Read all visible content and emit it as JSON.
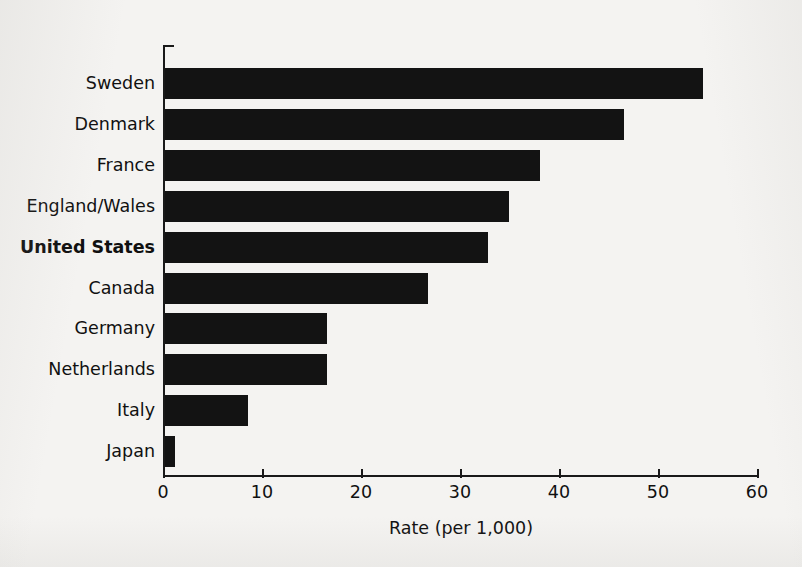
{
  "chart_data": {
    "type": "bar",
    "orientation": "horizontal",
    "title": "",
    "subtitle": "",
    "xlabel": "Rate (per 1,000)",
    "ylabel": "",
    "xlim": [
      0,
      60
    ],
    "xticks": [
      0,
      10,
      20,
      30,
      40,
      50,
      60
    ],
    "xtick_labels": [
      "0",
      "10",
      "20",
      "30",
      "40",
      "50",
      "60"
    ],
    "grid": false,
    "legend": null,
    "categories": [
      "Sweden",
      "Denmark",
      "France",
      "England/Wales",
      "United States",
      "Canada",
      "Germany",
      "Netherlands",
      "Italy",
      "Japan"
    ],
    "values": [
      54.3,
      46.4,
      37.9,
      34.7,
      32.6,
      26.6,
      16.4,
      16.4,
      8.4,
      1.0
    ],
    "highlighted_category": "United States",
    "bar_color": "#131313",
    "axis_color": "#191919",
    "background_color": "#f4f3f1"
  }
}
